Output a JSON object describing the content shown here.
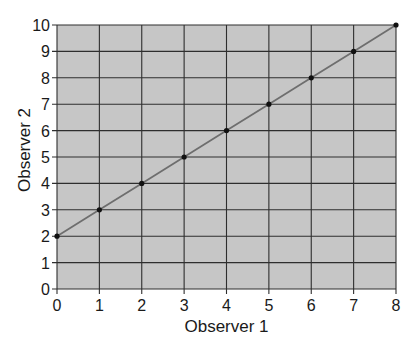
{
  "chart_data": {
    "type": "line",
    "title": "",
    "xlabel": "Observer 1",
    "ylabel": "Observer 2",
    "xlim": [
      0,
      8
    ],
    "ylim": [
      0,
      10
    ],
    "x_ticks": [
      0,
      1,
      2,
      3,
      4,
      5,
      6,
      7,
      8
    ],
    "y_ticks": [
      0,
      1,
      2,
      3,
      4,
      5,
      6,
      7,
      8,
      9,
      10
    ],
    "grid": true,
    "legend": null,
    "series": [
      {
        "name": "Observer 2 vs Observer 1",
        "x": [
          0,
          1,
          2,
          3,
          4,
          5,
          6,
          7,
          8
        ],
        "y": [
          2,
          3,
          4,
          5,
          6,
          7,
          8,
          9,
          10
        ],
        "markers": true,
        "line": true
      }
    ],
    "colors": {
      "plot_background": "#c6c6c6",
      "grid": "#2e2e2e",
      "line": "#6e6e6e",
      "marker": "#111111"
    }
  }
}
